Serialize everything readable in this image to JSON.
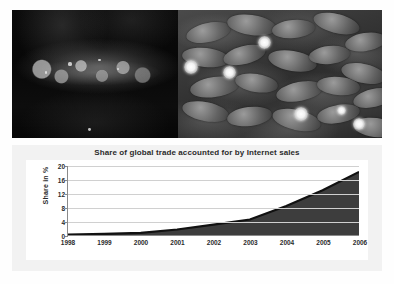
{
  "photos": {
    "left": {
      "alt": "dark pond with raft of lily pads",
      "specks": [
        {
          "x": 34,
          "y": 41,
          "r": 1.6
        },
        {
          "x": 52,
          "y": 38,
          "r": 1.2
        },
        {
          "x": 63,
          "y": 45,
          "r": 1.0
        },
        {
          "x": 20,
          "y": 48,
          "r": 1.1
        },
        {
          "x": 46,
          "y": 92,
          "r": 1.4
        }
      ]
    },
    "right": {
      "alt": "water lilies in bloom among lily pads",
      "pads": [
        {
          "x": 4,
          "y": 10,
          "w": 22,
          "h": 15,
          "rot": -12
        },
        {
          "x": 24,
          "y": 4,
          "w": 24,
          "h": 16,
          "rot": 8
        },
        {
          "x": 46,
          "y": 8,
          "w": 21,
          "h": 14,
          "rot": -5
        },
        {
          "x": 66,
          "y": 3,
          "w": 23,
          "h": 15,
          "rot": 14
        },
        {
          "x": 82,
          "y": 18,
          "w": 20,
          "h": 14,
          "rot": -9
        },
        {
          "x": 2,
          "y": 30,
          "w": 23,
          "h": 15,
          "rot": 6
        },
        {
          "x": 22,
          "y": 28,
          "w": 21,
          "h": 14,
          "rot": -14
        },
        {
          "x": 44,
          "y": 32,
          "w": 24,
          "h": 16,
          "rot": 10
        },
        {
          "x": 64,
          "y": 28,
          "w": 20,
          "h": 14,
          "rot": -6
        },
        {
          "x": 80,
          "y": 42,
          "w": 22,
          "h": 15,
          "rot": 12
        },
        {
          "x": 6,
          "y": 52,
          "w": 24,
          "h": 16,
          "rot": -8
        },
        {
          "x": 28,
          "y": 50,
          "w": 21,
          "h": 14,
          "rot": 9
        },
        {
          "x": 48,
          "y": 56,
          "w": 23,
          "h": 15,
          "rot": -11
        },
        {
          "x": 68,
          "y": 52,
          "w": 21,
          "h": 14,
          "rot": 5
        },
        {
          "x": 86,
          "y": 62,
          "w": 20,
          "h": 14,
          "rot": -13
        },
        {
          "x": 2,
          "y": 72,
          "w": 23,
          "h": 15,
          "rot": 11
        },
        {
          "x": 24,
          "y": 76,
          "w": 22,
          "h": 15,
          "rot": -7
        },
        {
          "x": 46,
          "y": 78,
          "w": 24,
          "h": 16,
          "rot": 13
        },
        {
          "x": 68,
          "y": 74,
          "w": 21,
          "h": 14,
          "rot": -10
        },
        {
          "x": 86,
          "y": 84,
          "w": 22,
          "h": 15,
          "rot": 7
        }
      ],
      "blooms": [
        {
          "x": 39,
          "y": 20,
          "s": 13
        },
        {
          "x": 3,
          "y": 39,
          "s": 14
        },
        {
          "x": 22,
          "y": 44,
          "s": 13
        },
        {
          "x": 57,
          "y": 76,
          "s": 14
        },
        {
          "x": 78,
          "y": 75,
          "s": 9
        },
        {
          "x": 86,
          "y": 84,
          "s": 12
        }
      ]
    }
  },
  "chart_data": {
    "type": "area",
    "title": "Share of global trade accounted for by Internet sales",
    "xlabel": "",
    "ylabel": "Share in %",
    "categories": [
      "1998",
      "1999",
      "2000",
      "2001",
      "2002",
      "2003",
      "2004",
      "2005",
      "2006"
    ],
    "values": [
      0.1,
      0.3,
      0.6,
      1.6,
      3.0,
      4.5,
      8.4,
      13.0,
      18.3
    ],
    "yticks": [
      0,
      4,
      8,
      12,
      16,
      20
    ],
    "ylim": [
      0,
      20
    ],
    "grid": true,
    "legend": "none",
    "series_color": "#3d3d3d",
    "line_color": "#111111"
  }
}
